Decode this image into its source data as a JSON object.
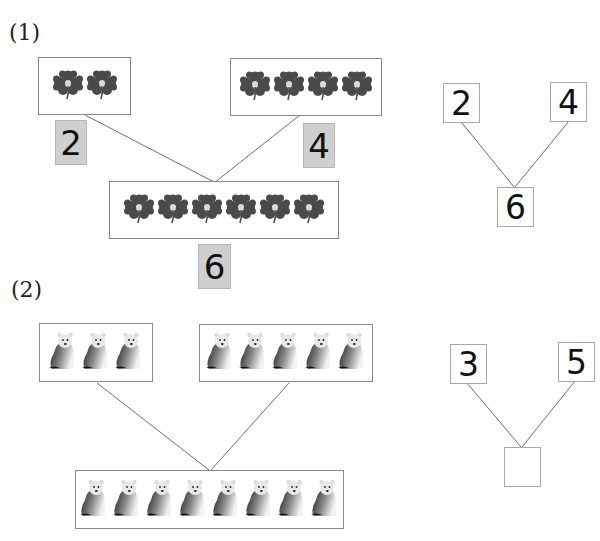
{
  "problem1": {
    "label": "(1)",
    "left_group": {
      "count": 2,
      "icon": "clover-icon",
      "tag": "2"
    },
    "right_group": {
      "count": 4,
      "icon": "clover-icon",
      "tag": "4"
    },
    "total_group": {
      "count": 6,
      "icon": "clover-icon",
      "tag": "6"
    },
    "number_bond": {
      "left": "2",
      "right": "4",
      "total": "6"
    }
  },
  "problem2": {
    "label": "(2)",
    "left_group": {
      "count": 3,
      "icon": "polar-bear-icon"
    },
    "right_group": {
      "count": 5,
      "icon": "polar-bear-icon"
    },
    "total_group": {
      "count": 8,
      "icon": "polar-bear-icon"
    },
    "number_bond": {
      "left": "3",
      "right": "5",
      "total": ""
    }
  },
  "colors": {
    "clover": "#4a4a4a",
    "clover_center": "#d9d9d9",
    "tag_bg": "#cfcfcf",
    "box_border": "#8a8a8a",
    "line": "#6e6e6e"
  }
}
